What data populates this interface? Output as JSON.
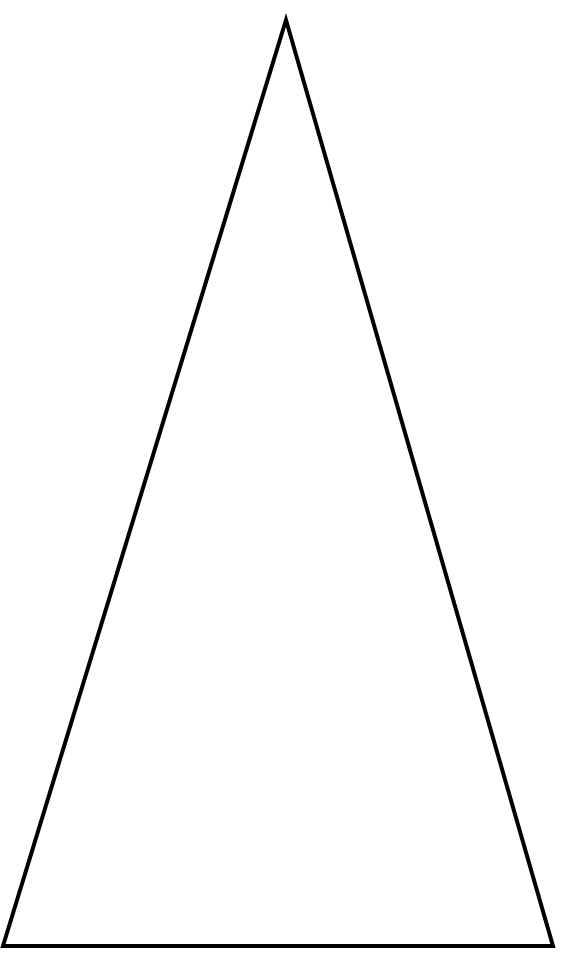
{
  "figure": {
    "shape": "isosceles-triangle",
    "width": 571,
    "height": 973,
    "background_color": "#ffffff",
    "stroke_color": "#000000",
    "stroke_width": 4,
    "fill": "none",
    "vertices": {
      "apex": [
        286,
        20
      ],
      "bottom_left": [
        3,
        946
      ],
      "bottom_right": [
        553,
        946
      ]
    },
    "points": "286,20 553,946 3,946"
  }
}
